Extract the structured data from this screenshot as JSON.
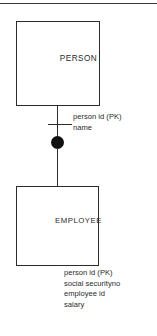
{
  "diagram": {
    "type": "entity-relationship-diagram",
    "title": "",
    "colors": {
      "stroke": "#2b2b2b",
      "fill": "#ffffff",
      "dot": "#111111",
      "rule": "#3a3a3a"
    },
    "top_rule": {
      "name": "page-rule",
      "visible": true
    },
    "entities": [
      {
        "id": "person",
        "label": "PERSON",
        "attributes": [
          "person id (PK)",
          "name"
        ]
      },
      {
        "id": "employee",
        "label": "EMPLOYEE",
        "attributes": [
          "person id (PK)",
          "social securityno",
          "employee id",
          "salary"
        ]
      }
    ],
    "connector": {
      "name": "relationship-connector",
      "from": "PERSON",
      "to": "EMPLOYEE",
      "marker_crossbar": "one",
      "marker_dot": "subtype"
    }
  }
}
